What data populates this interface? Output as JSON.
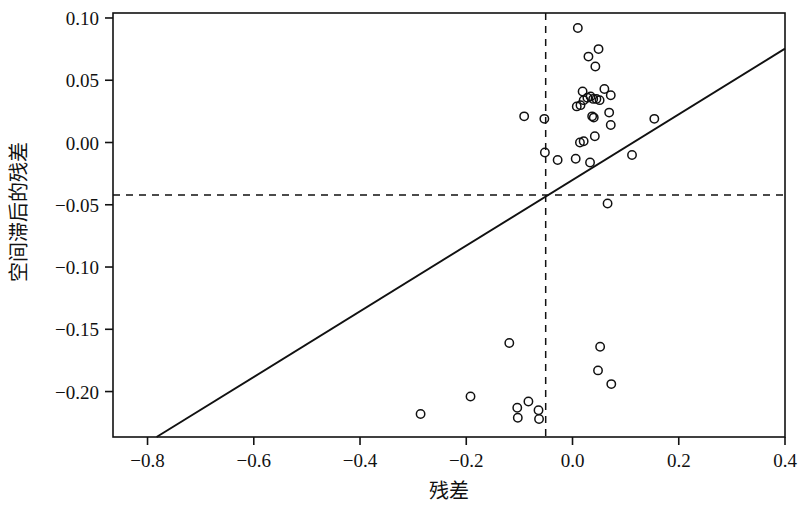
{
  "chart_data": {
    "type": "scatter",
    "title": "",
    "xlabel": "残差",
    "ylabel": "空间滞后的残差",
    "xlim": [
      -0.865,
      0.4
    ],
    "ylim": [
      -0.2365,
      0.104
    ],
    "xticks": [
      -0.8,
      -0.6,
      -0.4,
      -0.2,
      0.0,
      0.2,
      0.4
    ],
    "xticklabels": [
      "-0.8",
      "-0.6",
      "-0.4",
      "-0.2",
      "0.0",
      "0.2",
      "0.4"
    ],
    "yticks": [
      0.1,
      0.05,
      0.0,
      -0.05,
      -0.1,
      -0.15,
      -0.2
    ],
    "yticklabels": [
      "0.10",
      "0.05",
      "0.00",
      "-0.05",
      "-0.10",
      "-0.15",
      "-0.20"
    ],
    "grid": false,
    "legend": null,
    "reference_lines": [
      {
        "name": "vertical-mean-line",
        "orientation": "vertical",
        "value": -0.0505,
        "style": "dashed"
      },
      {
        "name": "horizontal-mean-line",
        "orientation": "horizontal",
        "value": -0.0421,
        "style": "dashed"
      }
    ],
    "fit_line": {
      "name": "moran-regression-line",
      "style": "solid",
      "x_start": -0.783,
      "y_start": -0.2365,
      "x_end": 0.4,
      "y_end": 0.0754,
      "slope": 0.2636,
      "intercept": -0.03,
      "label": ""
    },
    "points": [
      {
        "x": 0.01,
        "y": 0.092
      },
      {
        "x": 0.03,
        "y": 0.069
      },
      {
        "x": 0.049,
        "y": 0.075
      },
      {
        "x": 0.043,
        "y": 0.061
      },
      {
        "x": 0.06,
        "y": 0.043
      },
      {
        "x": 0.072,
        "y": 0.038
      },
      {
        "x": 0.019,
        "y": 0.041
      },
      {
        "x": 0.021,
        "y": 0.034
      },
      {
        "x": 0.028,
        "y": 0.036
      },
      {
        "x": 0.034,
        "y": 0.037
      },
      {
        "x": 0.039,
        "y": 0.035
      },
      {
        "x": 0.045,
        "y": 0.035
      },
      {
        "x": 0.051,
        "y": 0.034
      },
      {
        "x": 0.008,
        "y": 0.029
      },
      {
        "x": 0.015,
        "y": 0.03
      },
      {
        "x": 0.037,
        "y": 0.021
      },
      {
        "x": 0.04,
        "y": 0.02
      },
      {
        "x": 0.069,
        "y": 0.024
      },
      {
        "x": 0.072,
        "y": 0.014
      },
      {
        "x": -0.091,
        "y": 0.021
      },
      {
        "x": -0.053,
        "y": 0.019
      },
      {
        "x": 0.014,
        "y": 0.0
      },
      {
        "x": 0.021,
        "y": 0.001
      },
      {
        "x": 0.042,
        "y": 0.005
      },
      {
        "x": -0.052,
        "y": -0.008
      },
      {
        "x": -0.028,
        "y": -0.014
      },
      {
        "x": 0.006,
        "y": -0.013
      },
      {
        "x": 0.033,
        "y": -0.016
      },
      {
        "x": 0.112,
        "y": -0.01
      },
      {
        "x": 0.154,
        "y": 0.019
      },
      {
        "x": 0.066,
        "y": -0.049
      },
      {
        "x": 0.052,
        "y": -0.164
      },
      {
        "x": 0.048,
        "y": -0.183
      },
      {
        "x": 0.073,
        "y": -0.194
      },
      {
        "x": -0.119,
        "y": -0.161
      },
      {
        "x": -0.192,
        "y": -0.204
      },
      {
        "x": -0.286,
        "y": -0.218
      },
      {
        "x": -0.104,
        "y": -0.213
      },
      {
        "x": -0.103,
        "y": -0.221
      },
      {
        "x": -0.083,
        "y": -0.208
      },
      {
        "x": -0.064,
        "y": -0.215
      },
      {
        "x": -0.063,
        "y": -0.222
      }
    ]
  },
  "axis": {
    "x_title": "残差",
    "y_title": "空间滞后的残差"
  }
}
